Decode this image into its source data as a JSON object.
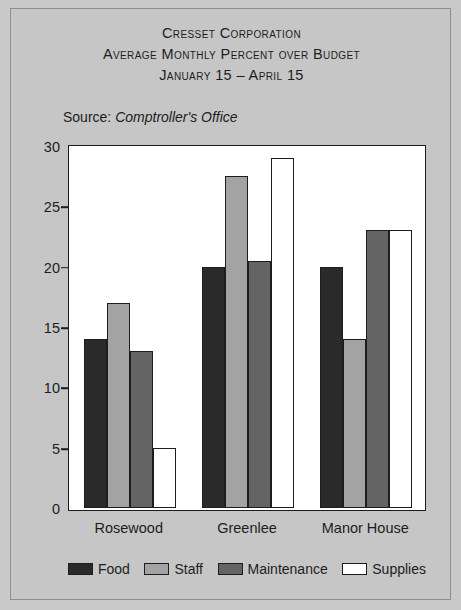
{
  "figure": {
    "title_lines": [
      "Cresset Corporation",
      "Average Monthly Percent over Budget",
      "January 15 – April 15"
    ],
    "source": {
      "label": "Source:",
      "value": "Comptroller's Office"
    }
  },
  "chart_data": {
    "type": "bar",
    "title": "Cresset Corporation Average Monthly Percent over Budget January 15 – April 15",
    "xlabel": "",
    "ylabel": "",
    "ylim": [
      0,
      30
    ],
    "yticks": [
      0,
      5,
      10,
      15,
      20,
      25,
      30
    ],
    "grid": false,
    "legend_position": "bottom",
    "categories": [
      "Rosewood",
      "Greenlee",
      "Manor House"
    ],
    "series": [
      {
        "name": "Food",
        "color": "#2a2a2a",
        "values": [
          14,
          20,
          20
        ]
      },
      {
        "name": "Staff",
        "color": "#a3a3a3",
        "values": [
          17,
          27.5,
          14
        ]
      },
      {
        "name": "Maintenance",
        "color": "#646464",
        "values": [
          13,
          20.5,
          23
        ]
      },
      {
        "name": "Supplies",
        "color": "#ffffff",
        "values": [
          5,
          29,
          23
        ]
      }
    ]
  }
}
